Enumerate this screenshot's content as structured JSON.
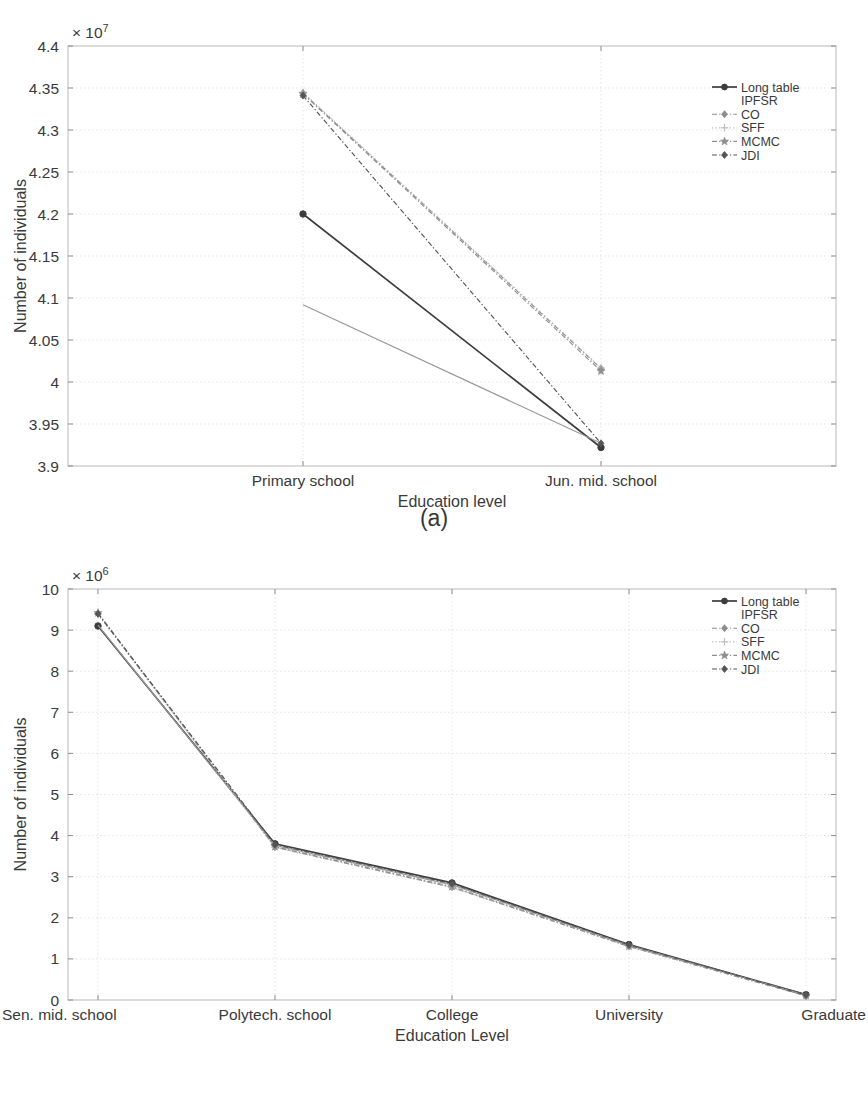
{
  "figure": {
    "subfigures": [
      {
        "id": "a",
        "caption": "(a)"
      },
      {
        "id": "b",
        "caption": "(b)"
      }
    ]
  },
  "legend": {
    "entries": [
      {
        "label": "Long table",
        "color": "#3d3d3d",
        "marker": "circle",
        "style": "solid",
        "has_sample": true
      },
      {
        "label": "IPFSR",
        "color": "#9a9a9a",
        "marker": "none",
        "style": "none",
        "has_sample": false
      },
      {
        "label": "CO",
        "color": "#8c8c8c",
        "marker": "diamond",
        "style": "dashdot",
        "has_sample": true
      },
      {
        "label": "SFF",
        "color": "#bdbdbd",
        "marker": "plus",
        "style": "dotted",
        "has_sample": true
      },
      {
        "label": "MCMC",
        "color": "#8f8f8f",
        "marker": "star",
        "style": "dashdot",
        "has_sample": true
      },
      {
        "label": "JDI",
        "color": "#555555",
        "marker": "diamond",
        "style": "dashdot",
        "has_sample": true
      }
    ]
  },
  "chart_data": [
    {
      "type": "line",
      "subfigure": "a",
      "title": "",
      "xlabel": "Education level",
      "ylabel": "Number of individuals",
      "categories": [
        "Primary school",
        "Jun. mid. school"
      ],
      "exponent_label": "× 10",
      "exponent_value": "7",
      "y_scale": 10000000,
      "ylim": [
        3.9,
        4.4
      ],
      "ytick_labels": [
        "3.9",
        "3.95",
        "4",
        "4.05",
        "4.1",
        "4.15",
        "4.2",
        "4.25",
        "4.3",
        "4.35",
        "4.4"
      ],
      "yticks": [
        3.9,
        3.95,
        4.0,
        4.05,
        4.1,
        4.15,
        4.2,
        4.25,
        4.3,
        4.35,
        4.4
      ],
      "grid": true,
      "legend_position": "top-right",
      "series": [
        {
          "name": "Long table",
          "values": [
            4.2,
            3.922
          ]
        },
        {
          "name": "IPFSR",
          "values": [
            4.092,
            3.927
          ]
        },
        {
          "name": "CO",
          "values": [
            4.344,
            4.016
          ]
        },
        {
          "name": "SFF",
          "values": [
            4.345,
            4.017
          ]
        },
        {
          "name": "MCMC",
          "values": [
            4.343,
            4.013
          ]
        },
        {
          "name": "JDI",
          "values": [
            4.341,
            3.927
          ]
        }
      ]
    },
    {
      "type": "line",
      "subfigure": "b",
      "title": "",
      "xlabel": "Education Level",
      "ylabel": "Number of individuals",
      "categories": [
        "Sen. mid. school",
        "Polytech. school",
        "College",
        "University",
        "Graduate"
      ],
      "exponent_label": "× 10",
      "exponent_value": "6",
      "y_scale": 1000000,
      "ylim": [
        0,
        10
      ],
      "ytick_labels": [
        "0",
        "1",
        "2",
        "3",
        "4",
        "5",
        "6",
        "7",
        "8",
        "9",
        "10"
      ],
      "yticks": [
        0,
        1,
        2,
        3,
        4,
        5,
        6,
        7,
        8,
        9,
        10
      ],
      "grid": true,
      "legend_position": "top-right",
      "series": [
        {
          "name": "Long table",
          "values": [
            9.1,
            3.8,
            2.85,
            1.35,
            0.13
          ]
        },
        {
          "name": "IPFSR",
          "values": [
            9.12,
            3.76,
            2.8,
            1.33,
            0.12
          ]
        },
        {
          "name": "CO",
          "values": [
            9.4,
            3.72,
            2.74,
            1.3,
            0.1
          ]
        },
        {
          "name": "SFF",
          "values": [
            9.38,
            3.71,
            2.74,
            1.3,
            0.1
          ]
        },
        {
          "name": "MCMC",
          "values": [
            9.42,
            3.73,
            2.76,
            1.31,
            0.11
          ]
        },
        {
          "name": "JDI",
          "values": [
            9.4,
            3.78,
            2.83,
            1.34,
            0.12
          ]
        }
      ]
    }
  ]
}
